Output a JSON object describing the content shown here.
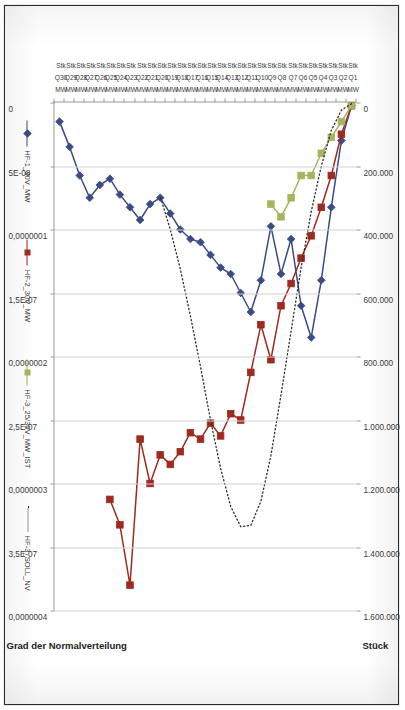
{
  "document": {
    "kind": "scanned-excel-chart",
    "orientation": "rotated-90-clockwise"
  },
  "chart_data": {
    "type": "line",
    "title": "",
    "subtitle": "",
    "grid": true,
    "legend_position": "bottom",
    "xlabel": "",
    "categories": [
      "Q1",
      "Q2",
      "Q3",
      "Q4",
      "Q5",
      "Q6",
      "Q7",
      "Q8",
      "Q9",
      "Q10",
      "Q11",
      "Q12",
      "Q13",
      "Q14",
      "Q15",
      "Q16",
      "Q17",
      "Q18",
      "Q19",
      "Q20",
      "Q21",
      "Q22",
      "Q23",
      "Q24",
      "Q25",
      "Q26",
      "Q27",
      "Q28",
      "Q29",
      "Q30"
    ],
    "category_sublabels": [
      "MW",
      "Stk"
    ],
    "primary_axis": {
      "title": "Stück",
      "ticks": [
        "0",
        "200.000",
        "400.000",
        "600.000",
        "800.000",
        "1.000.000",
        "1.200.000",
        "1.400.000",
        "1.600.000"
      ],
      "min": 0,
      "max": 1600000,
      "step": 200000
    },
    "secondary_axis": {
      "title": "Grad der Normalverteilung",
      "ticks": [
        "0",
        "5E-08",
        "0,0000001",
        "1,5E-07",
        "0,0000002",
        "2,5E-07",
        "0,0000003",
        "3,5E-07",
        "0,0000004"
      ],
      "min": 0,
      "max": 4e-07,
      "step": 5e-08
    },
    "series": [
      {
        "name": "HF-1_30V_MW",
        "axis": "primary",
        "color": "#3b4b86",
        "marker": "diamond",
        "line": "solid",
        "values": [
          10000,
          120000,
          330000,
          560000,
          740000,
          640000,
          430000,
          540000,
          390000,
          560000,
          660000,
          600000,
          540000,
          520000,
          480000,
          440000,
          430000,
          400000,
          350000,
          300000,
          320000,
          370000,
          330000,
          290000,
          240000,
          260000,
          300000,
          230000,
          140000,
          60000
        ]
      },
      {
        "name": "HF-2_30V_MW",
        "axis": "primary",
        "color": "#9e2a20",
        "marker": "square",
        "line": "solid",
        "values": [
          10000,
          100000,
          230000,
          330000,
          420000,
          490000,
          570000,
          640000,
          810000,
          700000,
          850000,
          1000000,
          980000,
          1050000,
          1010000,
          1060000,
          1040000,
          1100000,
          1140000,
          1110000,
          1200000,
          1060000,
          1520000,
          1330000,
          1250000,
          null,
          null,
          null,
          null,
          null
        ]
      },
      {
        "name": "HF-3_25/30V_MW_IST",
        "axis": "primary",
        "color": "#a8b45c",
        "marker": "square",
        "line": "solid",
        "values": [
          10000,
          60000,
          110000,
          160000,
          230000,
          230000,
          300000,
          360000,
          320000,
          null,
          null,
          null,
          null,
          null,
          null,
          null,
          null,
          null,
          null,
          null,
          null,
          null,
          null,
          null,
          null,
          null,
          null,
          null,
          null,
          null
        ]
      },
      {
        "name": "HF-3_SOLL_NV",
        "axis": "secondary",
        "color": "#2b2b2b",
        "marker": "none",
        "line": "dotted",
        "values": [
          1e-09,
          6e-09,
          2.2e-08,
          5e-08,
          8.6e-08,
          1.3e-07,
          1.8e-07,
          2.3e-07,
          2.78e-07,
          3.14e-07,
          3.33e-07,
          3.34e-07,
          3.18e-07,
          2.88e-07,
          2.5e-07,
          2.08e-07,
          1.68e-07,
          1.31e-07,
          1e-07,
          7.4e-08,
          null,
          null,
          null,
          null,
          null,
          null,
          null,
          null,
          null,
          null
        ]
      }
    ]
  },
  "legend": {
    "items": [
      {
        "label": "HF-1_30V_MW"
      },
      {
        "label": "HF-2_30V_MW"
      },
      {
        "label": "HF-3_25/30V_MW_IST"
      },
      {
        "label": "HF-3_SOLL_NV"
      }
    ]
  },
  "colors": {
    "series1": "#3b4b86",
    "series2": "#9e2a20",
    "series3": "#a8b45c",
    "series4": "#2b2b2b",
    "gridline": "#d2d2d2",
    "axis": "#9b9b9b",
    "paper": "#ffffff",
    "border": "#2b2b2b"
  }
}
